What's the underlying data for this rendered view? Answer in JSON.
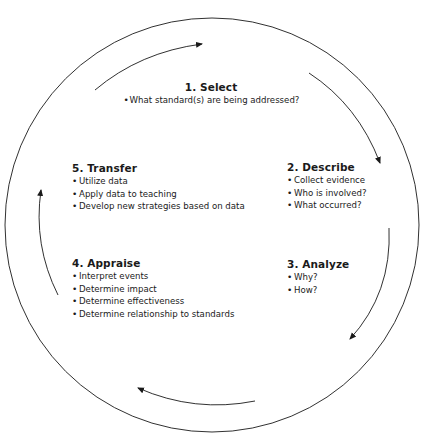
{
  "diagram": {
    "type": "cycle",
    "steps": [
      {
        "number": 1,
        "title": "1. Select",
        "items": [
          "What standard(s) are being addressed?"
        ]
      },
      {
        "number": 2,
        "title": "2. Describe",
        "items": [
          "Collect evidence",
          "Who is involved?",
          "What occurred?"
        ]
      },
      {
        "number": 3,
        "title": "3. Analyze",
        "items": [
          "Why?",
          "How?"
        ]
      },
      {
        "number": 4,
        "title": "4. Appraise",
        "items": [
          "Interpret events",
          "Determine impact",
          "Determine effectiveness",
          "Determine relationship to standards"
        ]
      },
      {
        "number": 5,
        "title": "5. Transfer",
        "items": [
          "Utilize data",
          "Apply data to teaching",
          "Develop new strategies based on data"
        ]
      }
    ],
    "arrow_direction": "clockwise",
    "colors": {
      "line": "#1a1a1a",
      "background": "#ffffff"
    }
  }
}
